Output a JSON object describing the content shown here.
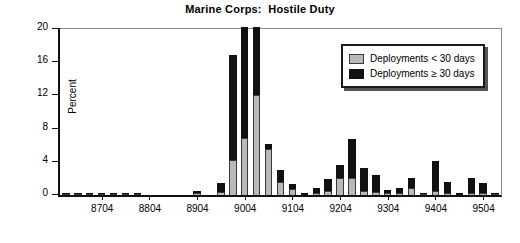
{
  "chart_data": {
    "type": "bar",
    "stacked": true,
    "title": "Marine Corps:  Hostile Duty",
    "xlabel": "",
    "ylabel": "Percent",
    "ylim": [
      0,
      20
    ],
    "yticks": [
      0,
      4,
      8,
      12,
      16,
      20
    ],
    "ytick_labels": [
      "0",
      "4",
      "8",
      "12",
      "16",
      "20"
    ],
    "grid": false,
    "legend_position": "upper-right",
    "xtick_labels": [
      "8704",
      "8804",
      "8904",
      "9004",
      "9104",
      "9204",
      "9304",
      "9404",
      "9504"
    ],
    "xtick_categories": [
      "8704",
      "8804",
      "8904",
      "9004",
      "9104",
      "9204",
      "9304",
      "9404",
      "9504"
    ],
    "categories": [
      "8701",
      "8702",
      "8703",
      "8704",
      "8801",
      "8802",
      "8803",
      "8804",
      "8901",
      "8902",
      "8903",
      "8904",
      "9001",
      "9002",
      "9003",
      "9004",
      "9101",
      "9102",
      "9103",
      "9104",
      "9201",
      "9202",
      "9203",
      "9204",
      "9301",
      "9302",
      "9303",
      "9304",
      "9401",
      "9402",
      "9403",
      "9404",
      "9501",
      "9502",
      "9503",
      "9504",
      "9601"
    ],
    "series": [
      {
        "name": "Deployments < 30 days",
        "color": "#b9b9b9",
        "values": [
          0.1,
          0.1,
          0.1,
          0.1,
          0.1,
          0.1,
          0.1,
          0.0,
          0.0,
          0.0,
          0.0,
          0.1,
          0.0,
          0.4,
          4.2,
          6.9,
          12.1,
          5.5,
          1.6,
          0.7,
          0.0,
          0.2,
          0.5,
          2.0,
          2.0,
          0.5,
          0.4,
          0.2,
          0.2,
          0.8,
          0.1,
          0.5,
          0.3,
          0.0,
          0.2,
          0.2,
          0.1
        ]
      },
      {
        "name": "Deployments ≥ 30 days",
        "color": "#111111",
        "values": [
          0.2,
          0.1,
          0.1,
          0.1,
          0.1,
          0.1,
          0.1,
          0.0,
          0.0,
          0.0,
          0.0,
          0.4,
          0.0,
          1.0,
          12.7,
          13.4,
          8.2,
          0.6,
          1.4,
          0.6,
          0.2,
          0.6,
          1.4,
          1.6,
          4.7,
          2.7,
          2.0,
          0.4,
          0.6,
          1.3,
          0.1,
          3.6,
          1.3,
          0.2,
          1.8,
          1.2,
          0.1
        ]
      }
    ],
    "totals": [
      0.3,
      0.2,
      0.2,
      0.2,
      0.2,
      0.2,
      0.2,
      0.0,
      0.0,
      0.0,
      0.0,
      0.5,
      0.0,
      1.4,
      16.9,
      20.3,
      20.3,
      6.1,
      3.0,
      1.3,
      0.2,
      0.8,
      1.9,
      3.6,
      6.7,
      3.2,
      2.4,
      0.6,
      0.8,
      2.1,
      0.2,
      4.1,
      1.6,
      0.2,
      2.0,
      1.4,
      0.2
    ]
  },
  "legend": {
    "entries": [
      {
        "label": "Deployments < 30 days",
        "swatch": "gray"
      },
      {
        "label": "Deployments ≥ 30 days",
        "swatch": "black"
      }
    ]
  }
}
